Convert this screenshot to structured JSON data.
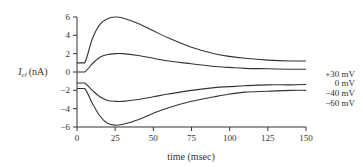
{
  "chart_data": {
    "type": "line",
    "title": "",
    "xlabel": "time (msec)",
    "ylabel": "I_cl (nA)",
    "ylabel_main": "I",
    "ylabel_sub": "cl",
    "ylabel_unit": "(nA)",
    "xlim": [
      0,
      150
    ],
    "ylim": [
      -6,
      6
    ],
    "x_ticks": [
      0,
      25,
      50,
      75,
      100,
      125,
      150
    ],
    "y_ticks": [
      -6,
      -4,
      -2,
      0,
      2,
      4,
      6
    ],
    "grid": false,
    "legend_position": "right, inline at curve ends",
    "x": [
      0,
      5,
      10,
      15,
      20,
      25,
      30,
      40,
      50,
      60,
      75,
      90,
      100,
      110,
      125,
      140,
      150
    ],
    "series": [
      {
        "name": "+30 mV",
        "values": [
          1.0,
          1.0,
          3.6,
          5.2,
          5.8,
          6.0,
          5.9,
          5.3,
          4.5,
          3.7,
          2.7,
          2.0,
          1.7,
          1.5,
          1.3,
          1.2,
          1.2
        ]
      },
      {
        "name": "0 mV",
        "values": [
          0.0,
          0.0,
          0.9,
          1.6,
          1.9,
          2.0,
          2.0,
          1.8,
          1.5,
          1.2,
          0.9,
          0.6,
          0.5,
          0.4,
          0.35,
          0.3,
          0.3
        ]
      },
      {
        "name": "-40 mV",
        "values": [
          -1.2,
          -1.2,
          -2.0,
          -2.7,
          -3.1,
          -3.2,
          -3.2,
          -3.0,
          -2.7,
          -2.4,
          -2.0,
          -1.7,
          -1.6,
          -1.5,
          -1.4,
          -1.4,
          -1.35
        ]
      },
      {
        "name": "-60 mV",
        "values": [
          -1.8,
          -1.8,
          -3.4,
          -4.8,
          -5.6,
          -5.8,
          -5.7,
          -5.2,
          -4.5,
          -3.9,
          -3.2,
          -2.7,
          -2.4,
          -2.2,
          -2.1,
          -2.0,
          -2.0
        ]
      }
    ]
  }
}
